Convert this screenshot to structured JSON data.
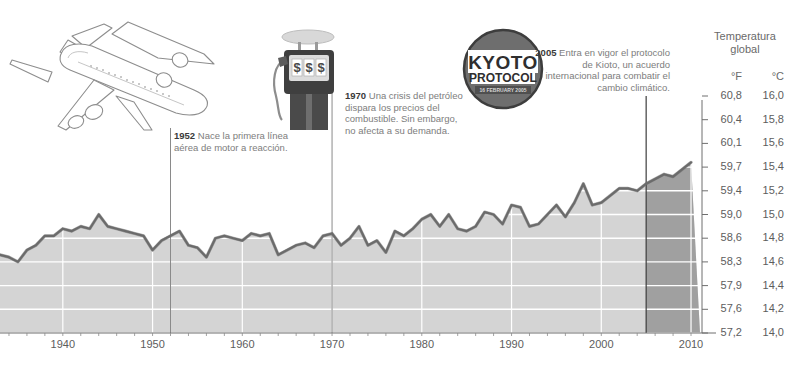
{
  "header": {
    "title_line1": "Temperatura",
    "title_line2": "global",
    "unit_f": "°F",
    "unit_c": "°C"
  },
  "annotations": [
    {
      "id": "note-1952",
      "year": "1952",
      "text": "Nace la primera línea aérea de motor a reacción.",
      "marker_year": 1952
    },
    {
      "id": "note-1970",
      "year": "1970",
      "text": "Una crisis del petróleo dispara los precios del combustible. Sin embargo, no afecta a su demanda.",
      "marker_year": 1970
    },
    {
      "id": "note-2005",
      "year": "2005",
      "text": "Entra en vigor el protocolo de Kioto, un acuerdo internacional para combatir el cambio climático.",
      "marker_year": 2005
    }
  ],
  "stamp": {
    "line1": "KYOTO",
    "line2": "PROTOCOL",
    "line3": "16 FEBRUARY 2005"
  },
  "illustrations": {
    "airplane": "airplane-illustration",
    "fuel_pump": "fuel-pump-illustration",
    "pump_display": "$ $ $"
  },
  "colors": {
    "line": "#6b6b6b",
    "area_fill": "#d4d4d4",
    "area_fill_projection": "#8f8f8f",
    "gridline": "#ffffff",
    "marker_line": "#8a8a8a",
    "text": "#5d5d5d",
    "text_bold": "#3a3a3a",
    "stamp": "#6e6e6e"
  },
  "chart_data": {
    "type": "area",
    "title": "Temperatura global",
    "xlabel": "",
    "ylabel": "Temperatura global",
    "grid": true,
    "legend_position": "none",
    "xlim": [
      1933,
      2011
    ],
    "ylim_f": [
      57.2,
      60.8
    ],
    "ylim_c": [
      14.0,
      16.0
    ],
    "x_ticks": [
      1940,
      1950,
      1960,
      1970,
      1980,
      1990,
      2000,
      2010
    ],
    "y_ticks_f": [
      "60,8",
      "60,4",
      "60,1",
      "59,7",
      "59,4",
      "59,0",
      "58,6",
      "58,3",
      "57,9",
      "57,6",
      "57,2"
    ],
    "y_ticks_c": [
      "16,0",
      "15,8",
      "15,6",
      "15,4",
      "15,2",
      "15,0",
      "14,8",
      "14,6",
      "14,4",
      "14,2",
      "14,0"
    ],
    "y_ticks_f_values": [
      60.8,
      60.4,
      60.1,
      59.7,
      59.4,
      59.0,
      58.6,
      58.3,
      57.9,
      57.6,
      57.2
    ],
    "y_ticks_c_values": [
      16.0,
      15.8,
      15.6,
      15.4,
      15.2,
      15.0,
      14.8,
      14.6,
      14.4,
      14.2,
      14.0
    ],
    "series_name": "Temperatura media global (°C)",
    "projection_start_year": 2005,
    "x": [
      1933,
      1934,
      1935,
      1936,
      1937,
      1938,
      1939,
      1940,
      1941,
      1942,
      1943,
      1944,
      1945,
      1946,
      1947,
      1948,
      1949,
      1950,
      1951,
      1952,
      1953,
      1954,
      1955,
      1956,
      1957,
      1958,
      1959,
      1960,
      1961,
      1962,
      1963,
      1964,
      1965,
      1966,
      1967,
      1968,
      1969,
      1970,
      1971,
      1972,
      1973,
      1974,
      1975,
      1976,
      1977,
      1978,
      1979,
      1980,
      1981,
      1982,
      1983,
      1984,
      1985,
      1986,
      1987,
      1988,
      1989,
      1990,
      1991,
      1992,
      1993,
      1994,
      1995,
      1996,
      1997,
      1998,
      1999,
      2000,
      2001,
      2002,
      2003,
      2004,
      2005,
      2006,
      2007,
      2008,
      2009,
      2010
    ],
    "values_c": [
      14.66,
      14.64,
      14.6,
      14.7,
      14.74,
      14.82,
      14.82,
      14.88,
      14.86,
      14.9,
      14.88,
      15.0,
      14.9,
      14.88,
      14.86,
      14.84,
      14.82,
      14.7,
      14.78,
      14.82,
      14.86,
      14.74,
      14.72,
      14.64,
      14.8,
      14.82,
      14.8,
      14.78,
      14.84,
      14.82,
      14.84,
      14.66,
      14.7,
      14.74,
      14.76,
      14.72,
      14.82,
      14.84,
      14.74,
      14.8,
      14.9,
      14.74,
      14.78,
      14.68,
      14.86,
      14.82,
      14.88,
      14.96,
      15.0,
      14.9,
      15.0,
      14.88,
      14.86,
      14.9,
      15.02,
      15.0,
      14.92,
      15.08,
      15.06,
      14.9,
      14.92,
      15.0,
      15.08,
      14.98,
      15.1,
      15.26,
      15.08,
      15.1,
      15.16,
      15.22,
      15.22,
      15.2,
      15.26,
      15.3,
      15.34,
      15.32,
      15.38,
      15.44
    ]
  }
}
